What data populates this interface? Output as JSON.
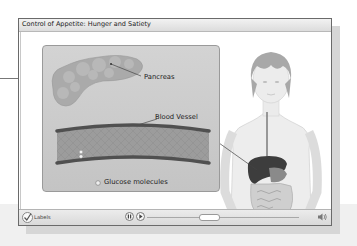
{
  "window": {
    "title": "Control of Appetite:  Hunger and Satiety"
  },
  "diagram": {
    "labels": {
      "pancreas": "Pancreas",
      "blood_vessel": "Blood Vessel",
      "glucose": "Glucose molecules"
    },
    "figure": "human-torso-with-digestive-organs"
  },
  "controls": {
    "labels_toggle": "Labels",
    "labels_checked": true,
    "pause_icon": "pause-icon",
    "play_icon": "play-icon",
    "volume_icon": "speaker-icon",
    "progress_position": 0.34
  },
  "colors": {
    "panel_bg": "#c9c9c9",
    "vessel_wall": "#555555",
    "liver": "#3a3a3a"
  }
}
